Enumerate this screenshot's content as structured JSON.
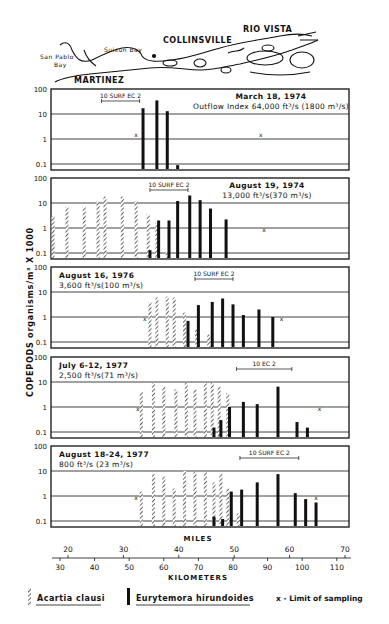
{
  "map": {
    "labels": [
      {
        "text": "RIO VISTA",
        "x": 243,
        "y": 32,
        "size": 8,
        "bold": true
      },
      {
        "text": "COLLINSVILLE",
        "x": 163,
        "y": 43,
        "size": 8,
        "bold": true
      },
      {
        "text": "Suisun Bay",
        "x": 104,
        "y": 52,
        "size": 6,
        "bold": false
      },
      {
        "text": "San Pablo",
        "x": 40,
        "y": 59,
        "size": 6,
        "bold": false
      },
      {
        "text": "Bay",
        "x": 54,
        "y": 67,
        "size": 6,
        "bold": false
      },
      {
        "text": "MARTINEZ",
        "x": 74,
        "y": 83,
        "size": 8,
        "bold": true
      }
    ]
  },
  "y_axis_label": "COPEPODS organisms/m³ X 1000",
  "legend": {
    "hatched": "Acartia clausi",
    "solid": "Eurytemora hirundoides",
    "x_marker": "x - Limit of sampling"
  },
  "x_axis": {
    "miles_title": "MILES",
    "km_title": "KILOMETERS",
    "miles_ticks": [
      "20",
      "30",
      "40",
      "50",
      "60",
      "70"
    ],
    "km_ticks": [
      "30",
      "40",
      "50",
      "60",
      "70",
      "80",
      "90",
      "100",
      "110"
    ]
  },
  "chart_data": {
    "type": "bar",
    "xlabel": "Kilometers (Miles)",
    "ylabel": "COPEPODS organisms/m³ X 1000",
    "yscale": "log",
    "ylim": [
      0.07,
      100
    ],
    "y_ticks": [
      "100",
      "10",
      "1",
      "0.1"
    ],
    "x_km_ticks": [
      30,
      40,
      50,
      60,
      70,
      80,
      90,
      100,
      110
    ],
    "x_mile_ticks": [
      20,
      30,
      40,
      50,
      60,
      70
    ],
    "legend": [
      "Acartia clausi",
      "Eurytemora hirundoides",
      "x - Limit of sampling"
    ],
    "panels": [
      {
        "title": "March 18, 1974",
        "subtitle": "Outflow Index 64,000 ft³/s (1800 m³/s)",
        "title_align": "right",
        "ec_label": "10 SURF EC 2",
        "ec_range_km": [
          42,
          53
        ],
        "limits_km": [
          52,
          88
        ],
        "acartia": [],
        "eurytemora": [
          [
            54,
            17
          ],
          [
            58,
            35
          ],
          [
            61,
            13
          ],
          [
            64,
            0.09
          ]
        ]
      },
      {
        "title": "August 19, 1974",
        "subtitle": "13,000 ft³/s(370 m³/s)",
        "title_align": "right",
        "ec_label": "10 SURF EC 2",
        "ec_range_km": [
          56,
          67
        ],
        "limits_km": [
          89
        ],
        "acartia": [
          [
            28,
            3
          ],
          [
            32,
            7
          ],
          [
            37,
            7
          ],
          [
            41,
            12
          ],
          [
            43,
            18
          ],
          [
            48,
            18
          ],
          [
            52,
            12
          ],
          [
            55.5,
            3.5
          ],
          [
            58,
            1.6
          ],
          [
            61,
            0.12
          ]
        ],
        "eurytemora": [
          [
            56,
            0.13
          ],
          [
            58.5,
            2
          ],
          [
            61.5,
            2
          ],
          [
            64,
            12
          ],
          [
            67.5,
            20
          ],
          [
            70.5,
            13
          ],
          [
            73.5,
            6
          ],
          [
            78,
            2.2
          ]
        ]
      },
      {
        "title": "August 16, 1976",
        "subtitle": "3,600 ft³/s(100 m³/s)",
        "title_align": "left",
        "ec_label": "10 SURF EC 2",
        "ec_range_km": [
          69,
          80
        ],
        "limits_km": [
          54.5,
          94
        ],
        "acartia": [
          [
            56,
            4
          ],
          [
            58,
            6
          ],
          [
            61,
            6.5
          ],
          [
            63,
            6
          ],
          [
            66,
            1.5
          ],
          [
            69.5,
            0.35
          ],
          [
            73,
            0.2
          ]
        ],
        "eurytemora": [
          [
            67,
            0.7
          ],
          [
            70,
            3
          ],
          [
            74,
            4
          ],
          [
            77,
            5.5
          ],
          [
            80,
            3.2
          ],
          [
            83,
            1.2
          ],
          [
            87.5,
            2
          ],
          [
            91.5,
            1
          ]
        ]
      },
      {
        "title": "July 6-12, 1977",
        "subtitle": "2,500 ft³/s(71 m³/s)",
        "title_align": "left",
        "ec_label": "10    EC    2",
        "ec_range_km": [
          81,
          97
        ],
        "limits_km": [
          52.5,
          105
        ],
        "acartia": [
          [
            53.5,
            4
          ],
          [
            57,
            9
          ],
          [
            60,
            6.5
          ],
          [
            63.5,
            5
          ],
          [
            66.5,
            9
          ],
          [
            69,
            5
          ],
          [
            72,
            9
          ],
          [
            74,
            9
          ],
          [
            76,
            6.5
          ],
          [
            78.5,
            3.5
          ]
        ],
        "eurytemora": [
          [
            74.5,
            0.15
          ],
          [
            76.5,
            0.3
          ],
          [
            79,
            1
          ],
          [
            83,
            1.6
          ],
          [
            87,
            1.3
          ],
          [
            93,
            6.5
          ],
          [
            98.5,
            0.25
          ],
          [
            101.5,
            0.15
          ]
        ]
      },
      {
        "title": "August 18-24, 1977",
        "subtitle": "800 ft³/s (23 m³/s)",
        "title_align": "left",
        "ec_label": "10  SURF EC   2",
        "ec_range_km": [
          82,
          99
        ],
        "limits_km": [
          52,
          104
        ],
        "acartia": [
          [
            53.5,
            1.5
          ],
          [
            57,
            7.5
          ],
          [
            60,
            6
          ],
          [
            63,
            2
          ],
          [
            66,
            10
          ],
          [
            69,
            9
          ],
          [
            72,
            9
          ],
          [
            74.5,
            3.5
          ],
          [
            76.5,
            8
          ],
          [
            78.5,
            2
          ],
          [
            81.5,
            0.2
          ]
        ],
        "eurytemora": [
          [
            74.5,
            0.15
          ],
          [
            77,
            0.12
          ],
          [
            79.5,
            1.5
          ],
          [
            82.5,
            1.8
          ],
          [
            87,
            3.5
          ],
          [
            93,
            7.5
          ],
          [
            98,
            1.3
          ],
          [
            101,
            0.75
          ],
          [
            104,
            0.55
          ]
        ]
      }
    ]
  }
}
